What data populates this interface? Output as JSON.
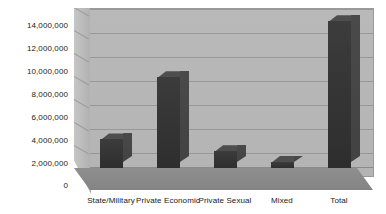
{
  "chart_data": {
    "type": "bar",
    "title": "",
    "xlabel": "",
    "ylabel": "",
    "categories": [
      "State/Military",
      "Private Economic",
      "Private Sexual",
      "Mixed",
      "Total"
    ],
    "values": [
      2400000,
      7600000,
      1400000,
      500000,
      12300000
    ],
    "ylim": [
      0,
      14000000
    ],
    "ytick_values": [
      0,
      2000000,
      4000000,
      6000000,
      8000000,
      10000000,
      12000000,
      14000000
    ],
    "ytick_labels": [
      "0",
      "2,000,000",
      "4,000,000",
      "6,000,000",
      "8,000,000",
      "10,000,000",
      "12,000,000",
      "14,000,000"
    ],
    "grid": true,
    "legend": false,
    "style": "3d-column",
    "colors": {
      "bar": "#343434",
      "bar_top": "#4e4e4e",
      "bar_side": "#464646",
      "plot_background": "#b6b6b6",
      "floor": "#8a8a8a",
      "gridline": "#989898",
      "text": "#1a1a1a",
      "page_background": "#ffffff"
    }
  }
}
